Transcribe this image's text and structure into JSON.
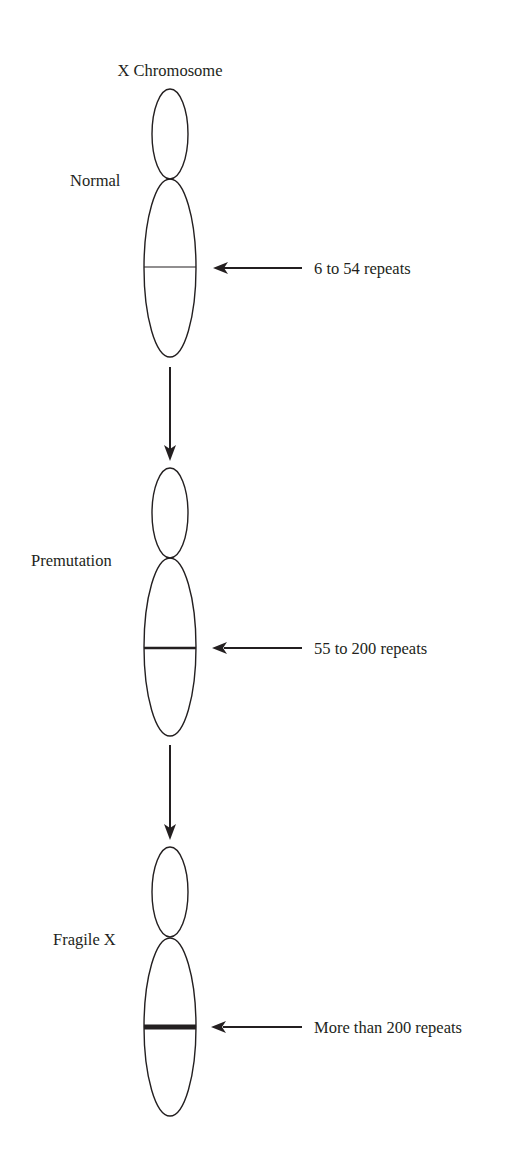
{
  "title": "X Chromosome",
  "stages": [
    {
      "label": "Normal",
      "repeats": "6 to 54 repeats",
      "band_weight": "thin"
    },
    {
      "label": "Premutation",
      "repeats": "55 to 200 repeats",
      "band_weight": "medium"
    },
    {
      "label": "Fragile X",
      "repeats": "More than 200 repeats",
      "band_weight": "thick"
    }
  ],
  "colors": {
    "ink": "#231f20",
    "background": "#ffffff"
  }
}
